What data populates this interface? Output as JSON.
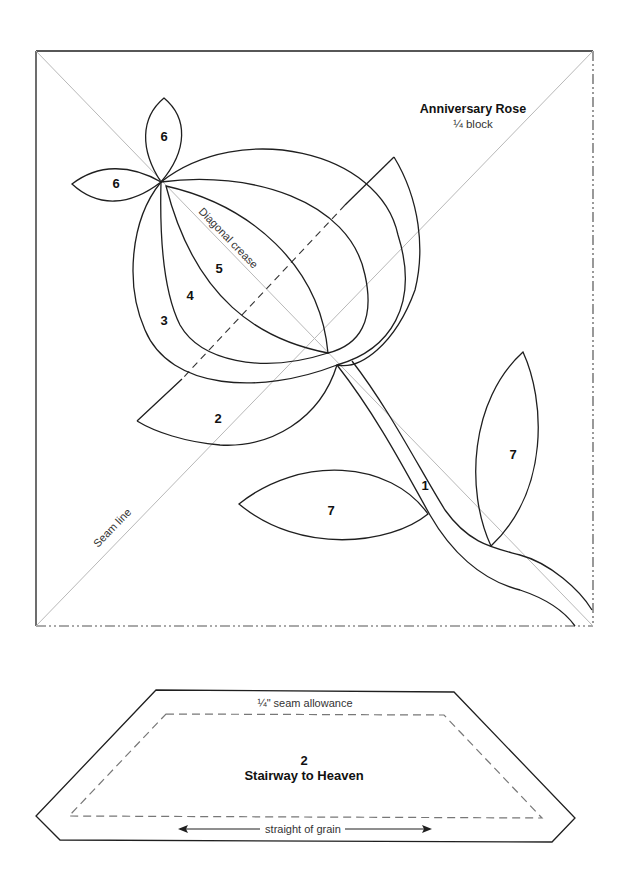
{
  "block": {
    "title": "Anniversary Rose",
    "subtitle": "¼ block",
    "labels": {
      "diagonal_crease": "Diagonal crease",
      "seam_line": "Seam line"
    },
    "pieces": [
      {
        "id": "petal-6-top",
        "number": "6"
      },
      {
        "id": "petal-6-left",
        "number": "6"
      },
      {
        "id": "petal-5",
        "number": "5"
      },
      {
        "id": "petal-4",
        "number": "4"
      },
      {
        "id": "petal-3",
        "number": "3"
      },
      {
        "id": "piece-2",
        "number": "2"
      },
      {
        "id": "stem-1",
        "number": "1"
      },
      {
        "id": "leaf-7-lower",
        "number": "7"
      },
      {
        "id": "leaf-7-upper",
        "number": "7"
      }
    ]
  },
  "template": {
    "piece_number": "2",
    "name": "Stairway to Heaven",
    "seam_allowance": "¼\" seam allowance",
    "grain_label": "straight of grain"
  },
  "colors": {
    "outline": "#1f1f1f",
    "guide": "#b8b8b8",
    "background": "#ffffff"
  }
}
